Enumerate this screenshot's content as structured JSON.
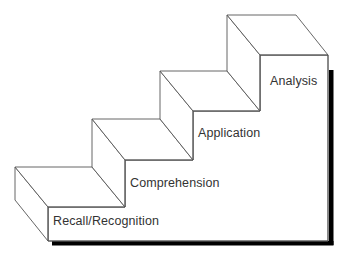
{
  "diagram": {
    "type": "staircase",
    "colors": {
      "stroke": "#555555",
      "shadow": "#000000",
      "text": "#333333",
      "background": "#ffffff"
    },
    "steps": [
      {
        "level": 1,
        "label": "Recall/Recognition"
      },
      {
        "level": 2,
        "label": "Comprehension"
      },
      {
        "level": 3,
        "label": "Application"
      },
      {
        "level": 4,
        "label": "Analysis"
      }
    ]
  }
}
